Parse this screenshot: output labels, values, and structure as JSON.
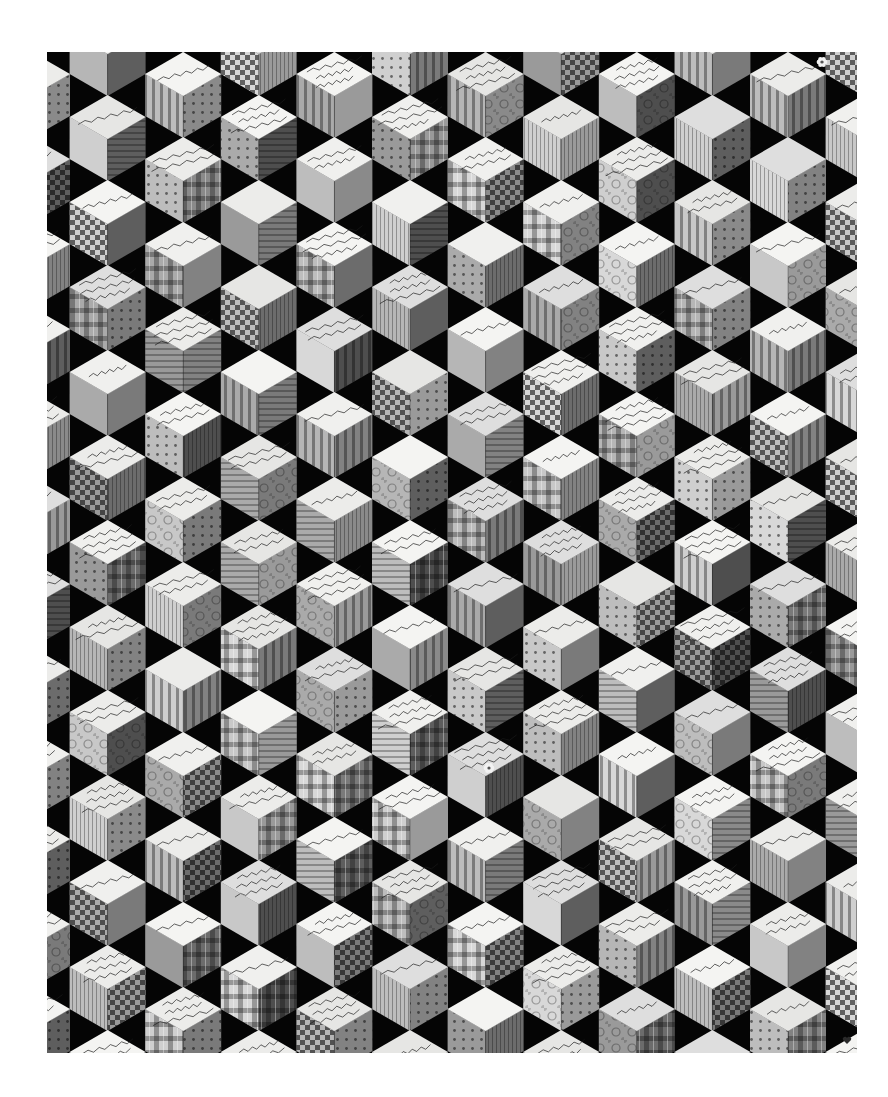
{
  "image": {
    "subject": "Tumbling blocks signature quilt (black and white photograph)",
    "canvas": {
      "width": 888,
      "height": 1097,
      "background": "#ffffff"
    },
    "photo_frame": {
      "x": 47,
      "y": 52,
      "width": 810,
      "height": 1001,
      "background": "#050505"
    }
  },
  "grid": {
    "column_pitch": 75.6,
    "row_pitch": 85,
    "first_column_center": 32,
    "cube_half_width": 38,
    "cube_top_face_half_height": 22,
    "cube_side_height": 42,
    "even_column_first_top": -33,
    "odd_column_first_top": 10,
    "columns": 12,
    "rows": 13
  },
  "palette": {
    "background_black": "#050505",
    "top_face_tones": [
      "#f4f4f2",
      "#ececea",
      "#e6e6e4",
      "#dedede",
      "#f0f0ee"
    ],
    "left_face_tones": [
      "#cfcfcf",
      "#bdbdbd",
      "#aaaaaa",
      "#c8c8c8",
      "#9a9a9a",
      "#b6b6b6",
      "#d8d8d8"
    ],
    "right_face_tones": [
      "#7a7a7a",
      "#5e5e5e",
      "#8a8a8a",
      "#6c6c6c",
      "#4e4e4e",
      "#9a9a9a",
      "#828282"
    ],
    "ink": "#1a1a1a"
  },
  "face_patterns": [
    "solid",
    "stripes-vertical",
    "stripes-horizontal",
    "plaid",
    "check",
    "dots",
    "floral",
    "pinstripe"
  ],
  "inscriptions": {
    "style": "handwritten ink signatures on top faces",
    "legibility": "illegible at this resolution",
    "notes": "Most top faces carry 1–4 lines of cursive names, places and dates"
  },
  "motifs": [
    {
      "type": "small-flower-appliqué",
      "approx_x": 489,
      "approx_y": 768
    },
    {
      "type": "small-flower-appliqué",
      "approx_x": 822,
      "approx_y": 62
    },
    {
      "type": "small-heart-motif",
      "approx_x": 847,
      "approx_y": 1040
    }
  ]
}
